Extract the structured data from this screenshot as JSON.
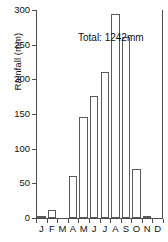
{
  "chart_data": {
    "type": "bar",
    "title": "",
    "xlabel": "",
    "ylabel": "Rainfall (mm)",
    "categories": [
      "J",
      "F",
      "M",
      "A",
      "M",
      "J",
      "J",
      "A",
      "S",
      "O",
      "N",
      "D"
    ],
    "category_names": [
      "January",
      "February",
      "March",
      "April",
      "May",
      "June",
      "July",
      "August",
      "September",
      "October",
      "November",
      "December"
    ],
    "values": [
      2,
      12,
      0,
      61,
      146,
      176,
      210,
      294,
      261,
      71,
      3,
      0
    ],
    "series": [
      {
        "name": "Rainfall",
        "values": [
          2,
          12,
          0,
          61,
          146,
          176,
          210,
          294,
          261,
          71,
          3,
          0
        ]
      }
    ],
    "ylim": [
      0,
      300
    ],
    "yticks": [
      0,
      50,
      100,
      150,
      200,
      250,
      300
    ],
    "ytick_labels": [
      "0",
      "50",
      "100",
      "150",
      "200",
      "250",
      "300"
    ],
    "grid": false,
    "legend": null,
    "annotations": [
      {
        "text": "Total: 1242mm",
        "x": "M",
        "y": 270
      }
    ],
    "bar_fill_color": "#ffffff",
    "bar_edge_color": "#5a5a5a",
    "axis_color": "#4d4d4d",
    "text_color": "#111111"
  },
  "annotation": {
    "total_label": "Total: 1242mm"
  },
  "axis": {
    "y_title": "Rainfall (mm)"
  }
}
